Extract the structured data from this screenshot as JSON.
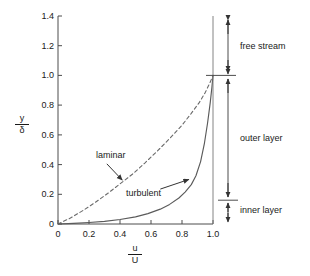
{
  "chart_data": {
    "type": "line",
    "title": "",
    "subtitle": "",
    "xlabel_numerator": "u",
    "xlabel_denominator": "U",
    "ylabel_numerator": "y",
    "ylabel_denominator": "δ",
    "xlim": [
      0,
      1.0
    ],
    "ylim": [
      0,
      1.4
    ],
    "xticks": [
      "0",
      "0.2",
      "0.4",
      "0.6",
      "0.8",
      "1.0"
    ],
    "xtick_values": [
      0,
      0.2,
      0.4,
      0.6,
      0.8,
      1.0
    ],
    "yticks": [
      "0",
      "0.2",
      "0.4",
      "0.6",
      "0.8",
      "1.0",
      "1.2",
      "1.4"
    ],
    "ytick_values": [
      0,
      0.2,
      0.4,
      0.6,
      0.8,
      1.0,
      1.2,
      1.4
    ],
    "grid": false,
    "legend": "none",
    "series": [
      {
        "name": "laminar",
        "style": "dashed",
        "points": [
          [
            0.0,
            0.0
          ],
          [
            0.08,
            0.04
          ],
          [
            0.16,
            0.09
          ],
          [
            0.24,
            0.145
          ],
          [
            0.32,
            0.205
          ],
          [
            0.4,
            0.27
          ],
          [
            0.48,
            0.335
          ],
          [
            0.56,
            0.41
          ],
          [
            0.64,
            0.49
          ],
          [
            0.72,
            0.575
          ],
          [
            0.8,
            0.665
          ],
          [
            0.86,
            0.745
          ],
          [
            0.91,
            0.815
          ],
          [
            0.95,
            0.885
          ],
          [
            0.98,
            0.95
          ],
          [
            1.0,
            1.0
          ]
        ]
      },
      {
        "name": "turbulent",
        "style": "solid",
        "points": [
          [
            0.0,
            0.0
          ],
          [
            0.1,
            0.004
          ],
          [
            0.2,
            0.01
          ],
          [
            0.3,
            0.018
          ],
          [
            0.4,
            0.03
          ],
          [
            0.5,
            0.048
          ],
          [
            0.58,
            0.07
          ],
          [
            0.66,
            0.1
          ],
          [
            0.72,
            0.132
          ],
          [
            0.78,
            0.175
          ],
          [
            0.82,
            0.215
          ],
          [
            0.86,
            0.265
          ],
          [
            0.89,
            0.325
          ],
          [
            0.92,
            0.42
          ],
          [
            0.945,
            0.545
          ],
          [
            0.965,
            0.68
          ],
          [
            0.982,
            0.815
          ],
          [
            0.993,
            0.92
          ],
          [
            1.0,
            1.0
          ]
        ]
      }
    ],
    "annotations": [
      {
        "name": "laminar",
        "label": "laminar",
        "label_x": 0.3,
        "label_y": 0.445,
        "arrow_from": [
          0.315,
          0.405
        ],
        "arrow_to": [
          0.415,
          0.295
        ]
      },
      {
        "name": "turbulent",
        "label": "turbulent",
        "label_x": 0.485,
        "label_y": 0.205,
        "arrow_from": [
          0.66,
          0.235
        ],
        "arrow_to": [
          0.845,
          0.3
        ]
      },
      {
        "name": "free-stream",
        "label": "free stream",
        "range": [
          1.0,
          1.4
        ],
        "label_y": 1.23
      },
      {
        "name": "outer-layer",
        "label": "outer layer",
        "range": [
          0.16,
          1.0
        ],
        "label_y": 0.56
      },
      {
        "name": "inner-layer",
        "label": "inner layer",
        "range": [
          0.0,
          0.16
        ],
        "label_y": 0.075
      }
    ],
    "boundary_markers": [
      1.0,
      0.16
    ]
  },
  "colors": {
    "axis": "#4d4d4d",
    "curve": "#555555",
    "text": "#1a1a1a",
    "annotation_line": "#4d4d4d",
    "background": "#ffffff"
  }
}
